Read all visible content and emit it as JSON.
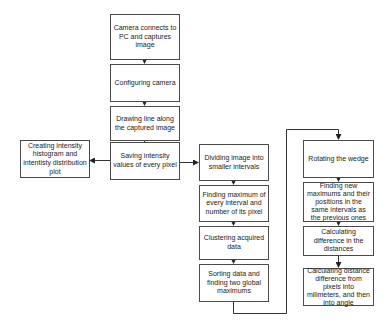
{
  "diagram": {
    "type": "flowchart",
    "nodes": [
      {
        "id": "camera_connect",
        "label": "Camera connects to PC and captures image"
      },
      {
        "id": "configure",
        "label": "Configuring camera"
      },
      {
        "id": "draw_line",
        "label": "Drawing line along the captured image"
      },
      {
        "id": "save_intensity",
        "label": "Saving intensity values of every pixel"
      },
      {
        "id": "histogram",
        "label": "Creating intensity histogram and intentisty distribution plot"
      },
      {
        "id": "divide",
        "label": "Dividing image into smaller intervals"
      },
      {
        "id": "find_max",
        "label": "Finding maximum of every interval and number of its pixel"
      },
      {
        "id": "cluster",
        "label": "Clustering acquired data"
      },
      {
        "id": "sort",
        "label": "Sorting data and finding two global maximums"
      },
      {
        "id": "rotate",
        "label": "Rotating the wedge"
      },
      {
        "id": "find_new",
        "label": "Finding new maximums and their positions in the same intervals as the previous ones"
      },
      {
        "id": "calc_diff",
        "label": "Calculating difference in the distances"
      },
      {
        "id": "convert",
        "label": "Calculating distance difference from pixels into milimeters, and then into angle"
      }
    ],
    "edges": [
      {
        "from": "camera_connect",
        "to": "configure"
      },
      {
        "from": "configure",
        "to": "draw_line"
      },
      {
        "from": "draw_line",
        "to": "save_intensity"
      },
      {
        "from": "save_intensity",
        "to": "histogram"
      },
      {
        "from": "save_intensity",
        "to": "divide"
      },
      {
        "from": "divide",
        "to": "find_max"
      },
      {
        "from": "find_max",
        "to": "cluster"
      },
      {
        "from": "cluster",
        "to": "sort"
      },
      {
        "from": "sort",
        "to": "rotate"
      },
      {
        "from": "rotate",
        "to": "find_new"
      },
      {
        "from": "find_new",
        "to": "calc_diff"
      },
      {
        "from": "calc_diff",
        "to": "convert"
      }
    ],
    "colors": {
      "line": "#333333",
      "box_border": "#4a4a4a",
      "background": "#ffffff"
    }
  }
}
